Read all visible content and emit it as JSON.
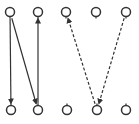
{
  "diagram": {
    "width": 139,
    "height": 124,
    "stroke_color": "#333333",
    "background": "#ffffff",
    "node_radius": 4.5,
    "top_row": [
      {
        "id": "t1",
        "x": 10,
        "y": 12
      },
      {
        "id": "t2",
        "x": 38,
        "y": 12
      },
      {
        "id": "t3",
        "x": 66,
        "y": 12
      },
      {
        "id": "t4",
        "x": 96,
        "y": 12
      },
      {
        "id": "t5",
        "x": 126,
        "y": 12
      }
    ],
    "bottom_row": [
      {
        "id": "b1",
        "x": 11,
        "y": 110
      },
      {
        "id": "b2",
        "x": 38,
        "y": 110
      },
      {
        "id": "b3",
        "x": 67,
        "y": 110
      },
      {
        "id": "b4",
        "x": 97,
        "y": 110
      },
      {
        "id": "b5",
        "x": 126,
        "y": 110
      }
    ],
    "edges": [
      {
        "from": "t1",
        "to": "b1",
        "style": "solid",
        "arrow": "end"
      },
      {
        "from": "t1",
        "to": "b2",
        "style": "solid",
        "arrow": "end"
      },
      {
        "from": "b2",
        "to": "t2",
        "style": "solid",
        "arrow": "end"
      },
      {
        "from": "b4",
        "to": "t3",
        "style": "dashed",
        "arrow": "end"
      },
      {
        "from": "t5",
        "to": "b4",
        "style": "dashed",
        "arrow": "end"
      }
    ]
  }
}
